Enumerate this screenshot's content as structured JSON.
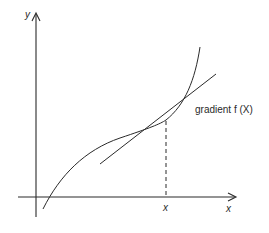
{
  "diagram": {
    "title": "",
    "axes": {
      "y_label": "y",
      "x_label": "x"
    },
    "point_label": "x",
    "tangent_label": "gradient f (X)",
    "colors": {
      "stroke": "#2a2a2a",
      "background": "#ffffff"
    }
  }
}
